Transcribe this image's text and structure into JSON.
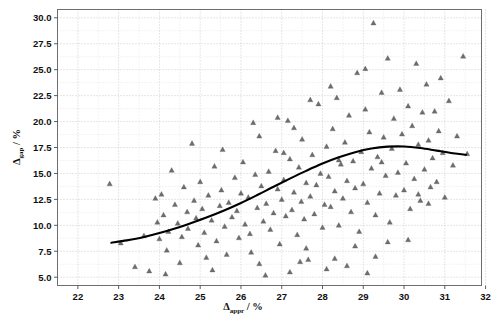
{
  "chart_data": {
    "type": "scatter",
    "title": "",
    "subtitle": "",
    "xlabel": "Δappr / %",
    "xlabel_symbol": "Δ",
    "xlabel_subscript": "appr",
    "xlabel_unit": "/ %",
    "ylabel": "Δgap / %",
    "ylabel_symbol": "Δ",
    "ylabel_subscript": "gap",
    "ylabel_unit": "/ %",
    "xlim": [
      21.5,
      31.9
    ],
    "ylim": [
      4.2,
      30.8
    ],
    "xticks": [
      22,
      23,
      24,
      25,
      26,
      27,
      28,
      29,
      30,
      31,
      32
    ],
    "xtick_labels": [
      "22",
      "23",
      "24",
      "25",
      "26",
      "27",
      "28",
      "29",
      "30",
      "31",
      "32"
    ],
    "yticks": [
      5.0,
      7.5,
      10.0,
      12.5,
      15.0,
      17.5,
      20.0,
      22.5,
      25.0,
      27.5,
      30.0
    ],
    "ytick_labels": [
      "5.0",
      "7.5",
      "10.0",
      "12.5",
      "15.0",
      "17.5",
      "20.0",
      "22.5",
      "25.0",
      "27.5",
      "30.0"
    ],
    "grid": true,
    "grid_style": "dotted",
    "legend": "none",
    "marker_shape": "triangle",
    "marker_color": "#6d6d6d",
    "trend_color": "#000000",
    "series": [
      {
        "name": "samples",
        "marker": "triangle",
        "points": [
          [
            22.78,
            14.0
          ],
          [
            23.05,
            8.3
          ],
          [
            23.4,
            6.0
          ],
          [
            23.62,
            9.0
          ],
          [
            23.9,
            12.6
          ],
          [
            23.95,
            10.3
          ],
          [
            24.0,
            8.7
          ],
          [
            24.05,
            13.0
          ],
          [
            24.1,
            11.0
          ],
          [
            24.18,
            7.6
          ],
          [
            24.22,
            9.4
          ],
          [
            24.3,
            15.3
          ],
          [
            24.38,
            12.0
          ],
          [
            24.45,
            10.2
          ],
          [
            24.5,
            6.4
          ],
          [
            24.55,
            8.9
          ],
          [
            24.6,
            13.7
          ],
          [
            24.68,
            11.3
          ],
          [
            24.7,
            9.7
          ],
          [
            24.8,
            17.9
          ],
          [
            24.85,
            12.4
          ],
          [
            24.9,
            10.7
          ],
          [
            24.95,
            8.1
          ],
          [
            25.0,
            14.2
          ],
          [
            25.05,
            11.6
          ],
          [
            25.1,
            9.3
          ],
          [
            25.15,
            6.9
          ],
          [
            25.2,
            12.9
          ],
          [
            25.28,
            10.5
          ],
          [
            25.35,
            15.7
          ],
          [
            25.4,
            8.5
          ],
          [
            25.48,
            11.9
          ],
          [
            25.52,
            13.4
          ],
          [
            25.6,
            9.9
          ],
          [
            25.65,
            7.2
          ],
          [
            25.7,
            12.2
          ],
          [
            25.78,
            10.8
          ],
          [
            25.85,
            14.6
          ],
          [
            25.9,
            11.4
          ],
          [
            25.95,
            8.8
          ],
          [
            26.0,
            13.1
          ],
          [
            26.05,
            16.1
          ],
          [
            26.1,
            10.1
          ],
          [
            26.18,
            12.7
          ],
          [
            26.22,
            9.2
          ],
          [
            26.3,
            19.9
          ],
          [
            26.35,
            14.9
          ],
          [
            26.4,
            11.7
          ],
          [
            26.45,
            6.3
          ],
          [
            26.5,
            13.8
          ],
          [
            26.55,
            10.4
          ],
          [
            26.62,
            12.1
          ],
          [
            26.68,
            15.2
          ],
          [
            26.72,
            9.6
          ],
          [
            26.8,
            11.2
          ],
          [
            26.85,
            17.2
          ],
          [
            26.9,
            13.5
          ],
          [
            26.95,
            8.2
          ],
          [
            27.0,
            12.5
          ],
          [
            27.05,
            14.4
          ],
          [
            27.1,
            10.9
          ],
          [
            27.15,
            20.1
          ],
          [
            27.2,
            16.4
          ],
          [
            27.25,
            11.5
          ],
          [
            27.3,
            13.2
          ],
          [
            27.38,
            9.1
          ],
          [
            27.42,
            15.6
          ],
          [
            27.48,
            12.3
          ],
          [
            27.5,
            18.3
          ],
          [
            27.55,
            10.6
          ],
          [
            27.6,
            14.1
          ],
          [
            27.65,
            6.7
          ],
          [
            27.7,
            12.8
          ],
          [
            27.75,
            16.8
          ],
          [
            27.8,
            11.1
          ],
          [
            27.85,
            13.9
          ],
          [
            27.9,
            21.7
          ],
          [
            27.95,
            15.0
          ],
          [
            28.0,
            9.8
          ],
          [
            28.05,
            12.0
          ],
          [
            28.1,
            17.6
          ],
          [
            28.15,
            14.7
          ],
          [
            28.2,
            11.8
          ],
          [
            28.25,
            19.3
          ],
          [
            28.3,
            13.3
          ],
          [
            28.35,
            22.3
          ],
          [
            28.4,
            10.0
          ],
          [
            28.45,
            15.9
          ],
          [
            28.5,
            12.6
          ],
          [
            28.55,
            18.0
          ],
          [
            28.6,
            14.3
          ],
          [
            28.65,
            20.6
          ],
          [
            28.7,
            11.3
          ],
          [
            28.75,
            16.2
          ],
          [
            28.8,
            13.6
          ],
          [
            28.85,
            24.7
          ],
          [
            28.9,
            9.4
          ],
          [
            28.95,
            17.1
          ],
          [
            29.0,
            14.0
          ],
          [
            29.05,
            21.2
          ],
          [
            29.1,
            12.2
          ],
          [
            29.15,
            19.0
          ],
          [
            29.2,
            15.5
          ],
          [
            29.25,
            29.5
          ],
          [
            29.3,
            11.0
          ],
          [
            29.35,
            16.6
          ],
          [
            29.4,
            13.1
          ],
          [
            29.45,
            22.8
          ],
          [
            29.5,
            18.5
          ],
          [
            29.55,
            14.8
          ],
          [
            29.6,
            26.1
          ],
          [
            29.65,
            10.3
          ],
          [
            29.7,
            17.4
          ],
          [
            29.75,
            20.3
          ],
          [
            29.8,
            12.9
          ],
          [
            29.85,
            15.1
          ],
          [
            29.9,
            23.1
          ],
          [
            29.95,
            18.8
          ],
          [
            30.0,
            13.4
          ],
          [
            30.05,
            16.0
          ],
          [
            30.1,
            21.5
          ],
          [
            30.15,
            11.6
          ],
          [
            30.2,
            19.6
          ],
          [
            30.25,
            14.5
          ],
          [
            30.3,
            25.6
          ],
          [
            30.35,
            17.8
          ],
          [
            30.4,
            12.4
          ],
          [
            30.45,
            20.9
          ],
          [
            30.5,
            15.4
          ],
          [
            30.55,
            23.6
          ],
          [
            30.6,
            18.2
          ],
          [
            30.65,
            13.7
          ],
          [
            30.7,
            16.5
          ],
          [
            30.75,
            21.0
          ],
          [
            30.8,
            14.2
          ],
          [
            30.85,
            19.1
          ],
          [
            30.9,
            24.2
          ],
          [
            30.95,
            17.0
          ],
          [
            31.0,
            12.7
          ],
          [
            31.1,
            22.0
          ],
          [
            31.2,
            15.8
          ],
          [
            31.3,
            18.6
          ],
          [
            31.45,
            26.3
          ],
          [
            31.55,
            16.9
          ],
          [
            23.75,
            5.6
          ],
          [
            24.15,
            5.3
          ],
          [
            25.3,
            5.7
          ],
          [
            26.6,
            5.2
          ],
          [
            27.2,
            5.5
          ],
          [
            28.1,
            5.8
          ],
          [
            28.6,
            6.1
          ],
          [
            29.1,
            5.4
          ],
          [
            27.45,
            6.5
          ],
          [
            28.3,
            6.8
          ],
          [
            29.3,
            7.0
          ],
          [
            26.25,
            7.4
          ],
          [
            27.6,
            7.8
          ],
          [
            28.8,
            8.0
          ],
          [
            29.6,
            8.4
          ],
          [
            30.1,
            8.6
          ],
          [
            25.55,
            17.3
          ],
          [
            26.45,
            18.6
          ],
          [
            27.05,
            17.0
          ],
          [
            27.3,
            19.4
          ],
          [
            28.4,
            16.3
          ],
          [
            26.9,
            20.4
          ],
          [
            29.45,
            16.1
          ],
          [
            30.6,
            12.1
          ],
          [
            29.05,
            25.1
          ],
          [
            28.2,
            23.4
          ],
          [
            27.7,
            22.1
          ],
          [
            30.35,
            13.0
          ]
        ]
      }
    ],
    "trend": {
      "name": "fitted curve",
      "points": [
        [
          22.82,
          8.32
        ],
        [
          23.2,
          8.55
        ],
        [
          23.6,
          8.85
        ],
        [
          24.0,
          9.25
        ],
        [
          24.4,
          9.72
        ],
        [
          24.8,
          10.25
        ],
        [
          25.2,
          10.82
        ],
        [
          25.6,
          11.45
        ],
        [
          26.0,
          12.15
        ],
        [
          26.4,
          12.92
        ],
        [
          26.8,
          13.72
        ],
        [
          27.2,
          14.5
        ],
        [
          27.6,
          15.25
        ],
        [
          28.0,
          15.95
        ],
        [
          28.4,
          16.55
        ],
        [
          28.8,
          17.05
        ],
        [
          29.2,
          17.4
        ],
        [
          29.6,
          17.58
        ],
        [
          30.0,
          17.6
        ],
        [
          30.4,
          17.45
        ],
        [
          30.8,
          17.2
        ],
        [
          31.2,
          16.95
        ],
        [
          31.52,
          16.8
        ]
      ]
    }
  },
  "figure": {
    "background": "#ffffff",
    "bottom_strip_text": ""
  }
}
